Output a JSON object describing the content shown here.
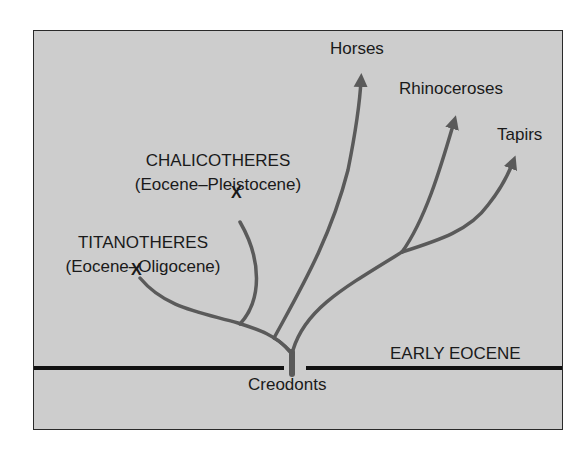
{
  "diagram": {
    "type": "phylogenetic-tree",
    "root": {
      "label": "Creodonts"
    },
    "horizon": {
      "label": "EARLY EOCENE"
    },
    "taxa": [
      {
        "label": "Horses",
        "status": "extant",
        "marker": "arrow"
      },
      {
        "label": "Rhinoceroses",
        "status": "extant",
        "marker": "arrow"
      },
      {
        "label": "Tapirs",
        "status": "extant",
        "marker": "arrow"
      },
      {
        "label": "CHALICOTHERES",
        "range": "(Eocene–Pleistocene)",
        "status": "extinct",
        "marker": "X"
      },
      {
        "label": "TITANOTHERES",
        "range": "(Eocene–Oligocene)",
        "status": "extinct",
        "marker": "X"
      }
    ],
    "colors": {
      "background": "#cdcdcd",
      "branch": "#5a5a5a",
      "text": "#1a1a1a",
      "horizon_line": "#111111"
    }
  }
}
